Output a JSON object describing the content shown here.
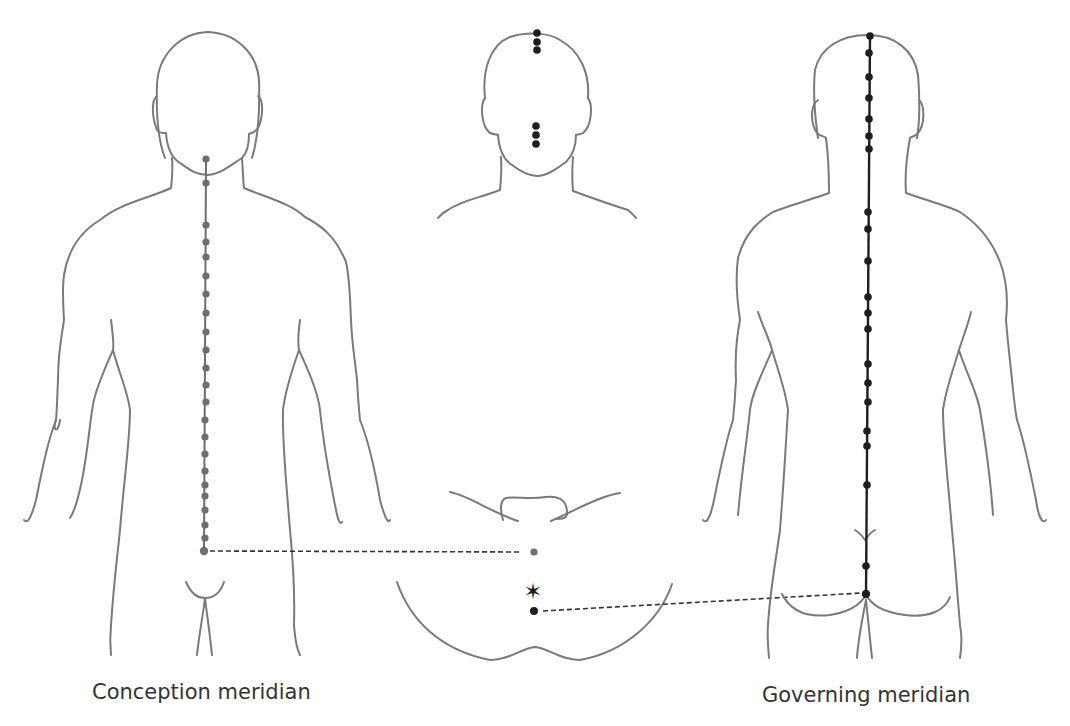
{
  "figure": {
    "labels": {
      "conception": "Conception meridian",
      "governing": "Governing meridian"
    },
    "colors": {
      "outline": "#7a7a7a",
      "conception_points": "#6e6e6e",
      "governing_points": "#1e1e1e",
      "text": "#333333"
    }
  },
  "panels": [
    {
      "id": "front-body",
      "view": "anterior",
      "meridian": "Conception meridian",
      "point_count": 24
    },
    {
      "id": "head-and-perineum",
      "view": "face / perineum inset",
      "meridian": "connections",
      "point_count": 9
    },
    {
      "id": "back-body",
      "view": "posterior",
      "meridian": "Governing meridian",
      "point_count": 28
    }
  ]
}
